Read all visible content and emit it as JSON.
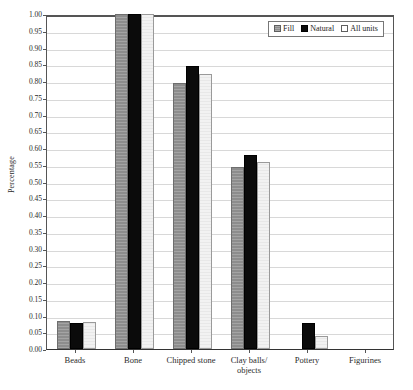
{
  "chart_data": {
    "type": "bar",
    "title": "",
    "subtitle": "",
    "xlabel": "",
    "ylabel": "Percentage",
    "ylim": [
      0.0,
      1.0
    ],
    "grid": true,
    "legend_position": "top-right",
    "categories": [
      "Beads",
      "Bone",
      "Chipped stone",
      "Clay balls/\nobjects",
      "Pottery",
      "Figurines"
    ],
    "ytick_labels": [
      "0.00",
      "0.05",
      "0.10",
      "0.15",
      "0.20",
      "0.25",
      "0.30",
      "0.35",
      "0.40",
      "0.45",
      "0.50",
      "0.55",
      "0.60",
      "0.65",
      "0.70",
      "0.75",
      "0.80",
      "0.85",
      "0.90",
      "0.95",
      "1.00"
    ],
    "ytick_values": [
      0.0,
      0.05,
      0.1,
      0.15,
      0.2,
      0.25,
      0.3,
      0.35,
      0.4,
      0.45,
      0.5,
      0.55,
      0.6,
      0.65,
      0.7,
      0.75,
      0.8,
      0.85,
      0.9,
      0.95,
      1.0
    ],
    "series": [
      {
        "name": "Fill",
        "color": "#8d8d8d",
        "values": [
          0.085,
          1.0,
          0.795,
          0.542,
          0.0,
          0.0
        ]
      },
      {
        "name": "Natural",
        "color": "#0b0b0b",
        "values": [
          0.078,
          1.0,
          0.845,
          0.58,
          0.078,
          0.0
        ]
      },
      {
        "name": "All units",
        "color": "#f2f2f2",
        "values": [
          0.08,
          1.0,
          0.82,
          0.558,
          0.04,
          0.0
        ]
      }
    ]
  },
  "legend": {
    "items": [
      {
        "label": "Fill"
      },
      {
        "label": "Natural"
      },
      {
        "label": "All units"
      }
    ]
  },
  "colors": {
    "fill_series": "#8d8d8d",
    "natural_series": "#0b0b0b",
    "allunits_series": "#f2f2f2",
    "gridline": "#d8d8d8",
    "axis": "#555555",
    "text": "#2b2b2b",
    "background": "#ffffff"
  }
}
